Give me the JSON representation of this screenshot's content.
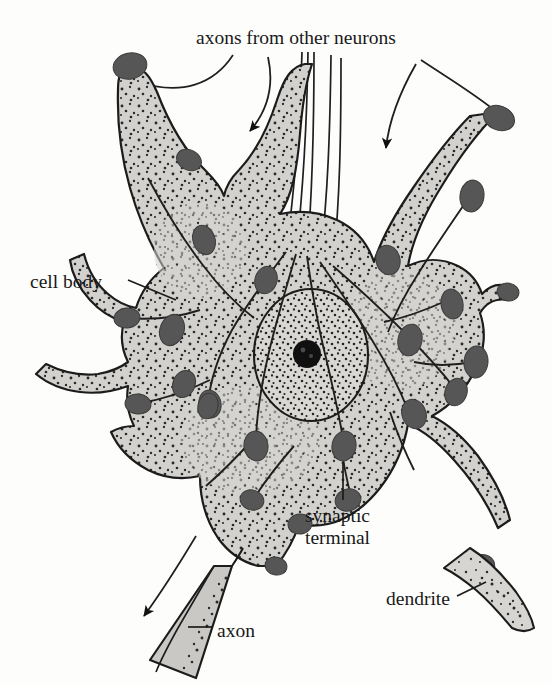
{
  "figure": {
    "background_color": "#fdfdfc"
  },
  "labels": {
    "axons_from_other_neurons": "axons from other neurons",
    "cell_body": "cell body",
    "synaptic_terminal_line1": "synaptic",
    "synaptic_terminal_line2": "terminal",
    "dendrite": "dendrite",
    "axon": "axon"
  },
  "colors": {
    "outline": "#1c1c1c",
    "cytoplasm_fill": "#d2d1cd",
    "nucleus_fill": "#d8d7d3",
    "bouton_fill": "#565656",
    "nucleolus_fill": "#101010",
    "stipple": "#2a2a2a",
    "text": "#191919",
    "leader_line": "#1c1c1c"
  },
  "parts": {
    "cell_body": "soma",
    "nucleus": "nucleus",
    "nucleolus": "nucleolus",
    "axon": "axon",
    "axon_hillock": "axon hillock",
    "dendrites": "dendrites",
    "synaptic_terminals": "synaptic terminal boutons",
    "incoming_fibers": "axons from other neurons"
  },
  "annotations": {
    "arrow_left": "signal direction into cell body (down-right)",
    "arrow_right": "signal direction into cell body (down)",
    "arrow_axon": "signal direction out along axon (down-left)"
  }
}
